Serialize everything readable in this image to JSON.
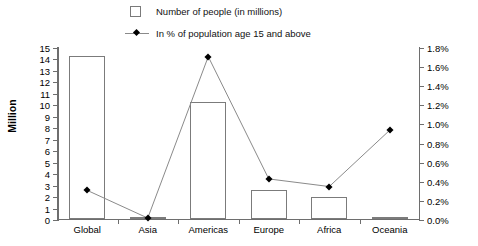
{
  "legend": {
    "items": [
      {
        "key": "bar-swatch",
        "label": "Number of people (in millions)"
      },
      {
        "key": "line-swatch",
        "label": "In % of population age 15 and above"
      }
    ]
  },
  "axes": {
    "left_title": "Million",
    "left_ticks": [
      "0",
      "1",
      "2",
      "3",
      "4",
      "5",
      "6",
      "7",
      "8",
      "9",
      "10",
      "11",
      "12",
      "13",
      "14",
      "15"
    ],
    "right_ticks": [
      "0.0%",
      "0.2%",
      "0.4%",
      "0.6%",
      "0.8%",
      "1.0%",
      "1.2%",
      "1.4%",
      "1.6%",
      "1.8%"
    ]
  },
  "colors": {
    "bar_stroke": "#7b7b7b",
    "bar_fill": "#ffffff",
    "line_stroke": "#8a8a8a",
    "marker_fill": "#000000",
    "axis": "#6e6e6e",
    "text": "#000000",
    "background": "#ffffff"
  },
  "chart_data": {
    "type": "bar",
    "title": "",
    "subtitle": "",
    "xlabel": "",
    "ylabel": "Million",
    "y2label": "",
    "categories": [
      "Global",
      "Asia",
      "Americas",
      "Europe",
      "Africa",
      "Oceania"
    ],
    "grid": false,
    "legend_position": "top",
    "ylim": [
      0,
      15
    ],
    "ytick_step": 1,
    "y2lim": [
      0,
      1.8
    ],
    "y2tick_step": 0.2,
    "y2_unit": "%",
    "series": [
      {
        "name": "Number of people (in millions)",
        "type": "bar",
        "axis": "left",
        "unit": "million",
        "values": [
          14.2,
          0.2,
          10.2,
          2.5,
          1.9,
          0.15
        ]
      },
      {
        "name": "In % of population age 15 and above",
        "type": "line",
        "axis": "right",
        "unit": "%",
        "values": [
          0.31,
          0.02,
          1.71,
          0.43,
          0.35,
          0.94
        ]
      }
    ]
  }
}
